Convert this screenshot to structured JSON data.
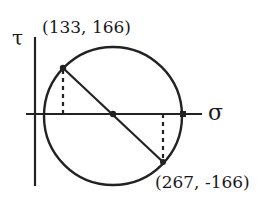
{
  "diagram": {
    "type": "mohr-circle",
    "axes": {
      "vertical_label": "τ",
      "horizontal_label": "σ"
    },
    "points": [
      {
        "name": "point-a",
        "label": "(133, 166)",
        "sigma": 133,
        "tau": 166
      },
      {
        "name": "point-b",
        "label": "(267, -166)",
        "sigma": 267,
        "tau": -166
      }
    ],
    "center_sigma": 200,
    "colors": {
      "stroke": "#222222",
      "background": "#ffffff"
    }
  }
}
